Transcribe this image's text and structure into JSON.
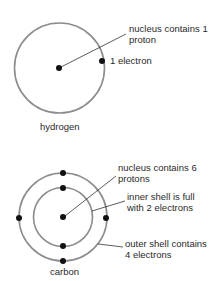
{
  "colors": {
    "shell": "#8c8c8c",
    "particle": "#111111",
    "leader": "#333333",
    "text": "#2a2a2a"
  },
  "hydrogen": {
    "name": "hydrogen",
    "nucleus_label": [
      "nucleus contains 1",
      "proton"
    ],
    "electron_label": "1 electron",
    "shells": 1,
    "electrons": 1
  },
  "carbon": {
    "name": "carbon",
    "nucleus_label": [
      "nucleus contains 6",
      "protons"
    ],
    "inner_label": [
      "inner shell is full",
      "with 2 electrons"
    ],
    "outer_label": [
      "outer shell contains",
      "4 electrons"
    ],
    "shells": 2,
    "electrons": 6
  }
}
